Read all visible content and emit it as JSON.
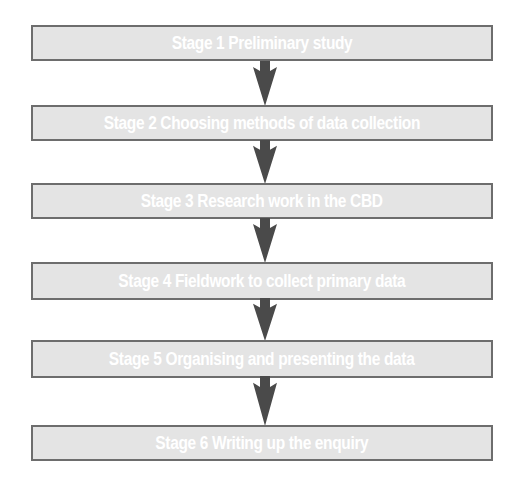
{
  "diagram": {
    "type": "flowchart",
    "direction": "top-to-bottom",
    "colors": {
      "box_fill": "#e4e4e4",
      "box_border": "#6d6d6d",
      "text": "#ffffff",
      "arrow": "#4a4a4a"
    },
    "stages": [
      {
        "label": "Stage 1 Preliminary study"
      },
      {
        "label": "Stage 2 Choosing methods of data collection"
      },
      {
        "label": "Stage 3 Research work in the CBD"
      },
      {
        "label": "Stage 4 Fieldwork to collect primary data"
      },
      {
        "label": "Stage 5 Organising and presenting the data"
      },
      {
        "label": "Stage 6 Writing up the enquiry"
      }
    ],
    "connectors": [
      {
        "from": 1,
        "to": 2,
        "icon": "down-arrow-icon"
      },
      {
        "from": 2,
        "to": 3,
        "icon": "down-arrow-icon"
      },
      {
        "from": 3,
        "to": 4,
        "icon": "down-arrow-icon"
      },
      {
        "from": 4,
        "to": 5,
        "icon": "down-arrow-icon"
      },
      {
        "from": 5,
        "to": 6,
        "icon": "down-arrow-icon"
      }
    ]
  }
}
